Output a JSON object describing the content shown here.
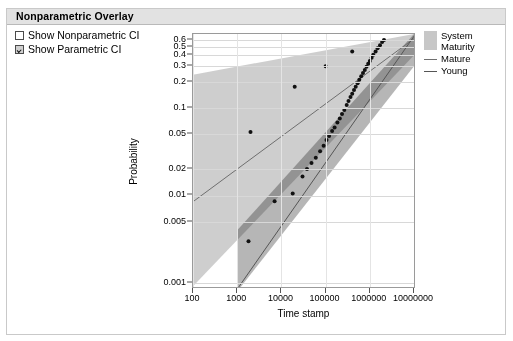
{
  "panel": {
    "header_title": "Nonparametric Overlay"
  },
  "controls": {
    "checkboxes": [
      {
        "label": "Show Nonparametric CI",
        "checked": false
      },
      {
        "label": "Show Parametric CI",
        "checked": true
      }
    ]
  },
  "legend": {
    "entries": [
      {
        "label_line1": "System",
        "label_line2": "Maturity",
        "type": "band",
        "color": "#c7c7c7"
      },
      {
        "label_line1": "Mature",
        "label_line2": "",
        "type": "line",
        "color": "#6f6f6f"
      },
      {
        "label_line1": "Young",
        "label_line2": "",
        "type": "line",
        "color": "#555555"
      }
    ]
  },
  "chart_data": {
    "type": "scatter",
    "title": "",
    "xlabel": "Time stamp",
    "ylabel": "Probability",
    "xscale": "log",
    "yscale": "log",
    "xlim": [
      100,
      10000000
    ],
    "ylim": [
      0.0009,
      0.7
    ],
    "grid": true,
    "legend_position": "right",
    "xticks": [
      100,
      1000,
      10000,
      100000,
      1000000,
      10000000
    ],
    "xtick_labels": [
      "100",
      "1000",
      "10000",
      "100000",
      "1000000",
      "10000000"
    ],
    "yticks": [
      0.6,
      0.5,
      0.4,
      0.3,
      0.2,
      0.1,
      0.05,
      0.02,
      0.01,
      0.005,
      0.001
    ],
    "ytick_labels": [
      "0.6",
      "0.5",
      "0.4",
      "0.3",
      "0.2",
      "0.1",
      "0.05",
      "0.02",
      "0.01",
      "0.005",
      "0.001"
    ],
    "series": [
      {
        "name": "Mature",
        "type": "line",
        "color": "#6f6f6f",
        "points": [
          [
            100,
            0.0085
          ],
          [
            10000000,
            0.62
          ]
        ]
      },
      {
        "name": "Young",
        "type": "line",
        "color": "#555555",
        "points": [
          [
            1000,
            0.00085
          ],
          [
            10000000,
            0.66
          ]
        ]
      },
      {
        "name": "Mature CI band",
        "type": "band",
        "color": "#bdbdbd",
        "lower": [
          [
            100,
            0.00092
          ],
          [
            10000000,
            0.4
          ]
        ],
        "upper": [
          [
            100,
            0.24
          ],
          [
            10000000,
            0.7
          ]
        ]
      },
      {
        "name": "Young CI band",
        "type": "band",
        "color": "#9e9e9e",
        "lower": [
          [
            1000,
            0.0008
          ],
          [
            10000000,
            0.3
          ]
        ],
        "upper": [
          [
            1000,
            0.004
          ],
          [
            10000000,
            0.7
          ]
        ]
      },
      {
        "name": "Mature observations",
        "type": "scatter",
        "color": "#111111",
        "points": [
          [
            2000,
            0.053
          ],
          [
            20000,
            0.175
          ],
          [
            100000,
            0.3
          ],
          [
            400000,
            0.44
          ]
        ]
      },
      {
        "name": "Young observations",
        "type": "scatter",
        "color": "#111111",
        "points": [
          [
            1800,
            0.003
          ],
          [
            7000,
            0.0086
          ],
          [
            18000,
            0.0105
          ],
          [
            30000,
            0.0165
          ],
          [
            38000,
            0.02
          ],
          [
            48000,
            0.0235
          ],
          [
            60000,
            0.027
          ],
          [
            75000,
            0.032
          ],
          [
            90000,
            0.037
          ],
          [
            105000,
            0.043
          ],
          [
            120000,
            0.048
          ],
          [
            140000,
            0.0545
          ],
          [
            160000,
            0.06
          ],
          [
            185000,
            0.068
          ],
          [
            210000,
            0.076
          ],
          [
            235000,
            0.085
          ],
          [
            265000,
            0.095
          ],
          [
            300000,
            0.108
          ],
          [
            330000,
            0.12
          ],
          [
            365000,
            0.133
          ],
          [
            400000,
            0.145
          ],
          [
            440000,
            0.16
          ],
          [
            480000,
            0.175
          ],
          [
            530000,
            0.192
          ],
          [
            580000,
            0.21
          ],
          [
            640000,
            0.23
          ],
          [
            700000,
            0.25
          ],
          [
            770000,
            0.272
          ],
          [
            840000,
            0.295
          ],
          [
            920000,
            0.32
          ],
          [
            1000000,
            0.345
          ],
          [
            1100000,
            0.375
          ],
          [
            1200000,
            0.405
          ],
          [
            1350000,
            0.44
          ],
          [
            1500000,
            0.48
          ],
          [
            1700000,
            0.52
          ],
          [
            1900000,
            0.565
          ],
          [
            2100000,
            0.6
          ]
        ]
      }
    ]
  }
}
